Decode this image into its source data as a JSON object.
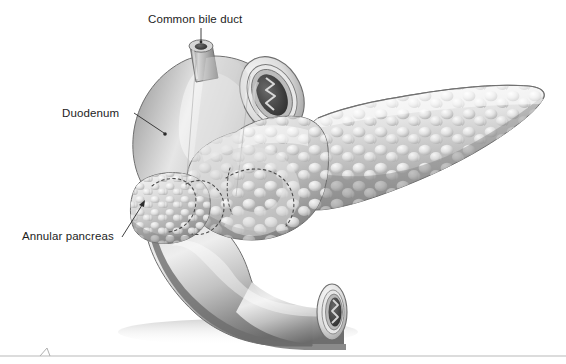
{
  "figure": {
    "type": "medical-illustration",
    "style": "grayscale airbrush anatomical drawing",
    "background_color": "#ffffff",
    "width": 566,
    "height": 364
  },
  "labels": {
    "common_bile_duct": "Common bile duct",
    "duodenum": "Duodenum",
    "annular_pancreas": "Annular pancreas"
  },
  "label_color": "#1d1d1d",
  "leader_line_color": "#2a2a2a",
  "structures": {
    "common_bile_duct": {
      "name": "common-bile-duct-stump",
      "description": "short cut cylindrical duct stump with dark elliptical lumen at its cut top"
    },
    "duodenum": {
      "name": "duodenum-loop",
      "description": "C-shaped smooth tube, cut open at upper-right and lower-right showing concentric wall layers and dark lumen with zigzag mucosal folds"
    },
    "pancreas": {
      "name": "pancreas-body-and-tail",
      "description": "lobulated cobblestone gland extending to the right, tapering to a pointed tail"
    },
    "annular_ring": {
      "name": "annular-pancreas-ring",
      "description": "band of pancreatic tissue encircling the descending duodenum, outlined with dotted borders and shown translucent where it passes in front"
    }
  },
  "palette": {
    "tissue_light": "#f2f2f2",
    "tissue_mid": "#c8c8c8",
    "tissue_dark": "#8a8a8a",
    "tissue_shadow": "#5a5a5a",
    "lumen_dark": "#3a3a3a",
    "outline": "#6e6e6e",
    "dotted_border": "#4a4a4a",
    "footer_rule": "#b9b9b9"
  },
  "footer": {
    "rule_present": true,
    "mark": "small caret mark on the rule near the left"
  }
}
